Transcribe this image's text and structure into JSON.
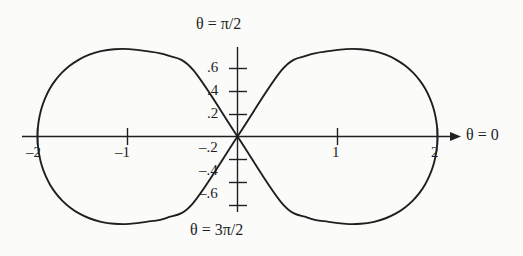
{
  "figure": {
    "problem_number": ".",
    "background_color": "#fbfbfa",
    "ink_color": "#1f1f1f"
  },
  "labels": {
    "theta_top": "θ = π/2",
    "theta_bottom": "θ = 3π/2",
    "theta_right": "θ = 0"
  },
  "axes": {
    "x_ticks": [
      {
        "value": -2,
        "label": "–2"
      },
      {
        "value": -1,
        "label": "–1"
      },
      {
        "value": 1,
        "label": "1"
      },
      {
        "value": 2,
        "label": "2"
      }
    ],
    "y_ticks": [
      {
        "value": 0.6,
        "label": ".6"
      },
      {
        "value": 0.4,
        "label": ".4"
      },
      {
        "value": 0.2,
        "label": ".2"
      },
      {
        "value": -0.2,
        "label": "–.2"
      },
      {
        "value": -0.4,
        "label": "–.4"
      },
      {
        "value": -0.6,
        "label": "–.6"
      }
    ]
  },
  "chart_data": {
    "type": "line",
    "title": "",
    "subtitle": "",
    "xlabel": "θ = 0",
    "ylabel": "θ = π/2",
    "curve_name": "lemniscate",
    "polar_equation": "r^2 = 4 cos(2θ)",
    "coordinate_system": "polar",
    "grid": false,
    "legend": false,
    "xlim": [
      -2.15,
      2.18
    ],
    "ylim": [
      -0.78,
      0.78
    ],
    "xticks": [
      -2,
      -1,
      1,
      2
    ],
    "yticks": [
      0.6,
      0.4,
      0.2,
      -0.2,
      -0.4,
      -0.6
    ],
    "axis_arrow": "right",
    "annotations": [
      {
        "text": "θ = π/2",
        "position": "top-of-y-axis"
      },
      {
        "text": "θ = 3π/2",
        "position": "bottom-of-y-axis"
      },
      {
        "text": "θ = 0",
        "position": "right-of-x-axis"
      }
    ],
    "series": [
      {
        "name": "r^2 = 4 cos(2θ)",
        "color": "#1f1f1f",
        "x": [
          2.0,
          1.995,
          1.98,
          1.956,
          1.921,
          1.876,
          1.82,
          1.753,
          1.675,
          1.585,
          1.482,
          1.366,
          1.234,
          1.084,
          0.911,
          0.707,
          0.448,
          0.0,
          -0.448,
          -0.707,
          -0.911,
          -1.084,
          -1.234,
          -1.366,
          -1.482,
          -1.585,
          -1.675,
          -1.753,
          -1.82,
          -1.876,
          -1.921,
          -1.956,
          -1.98,
          -1.995,
          -2.0,
          -1.995,
          -1.98,
          -1.956,
          -1.921,
          -1.876,
          -1.82,
          -1.753,
          -1.675,
          -1.585,
          -1.482,
          -1.366,
          -1.234,
          -1.084,
          -0.911,
          -0.707,
          -0.448,
          0.0,
          0.448,
          0.707,
          0.911,
          1.084,
          1.234,
          1.366,
          1.482,
          1.585,
          1.675,
          1.753,
          1.82,
          1.876,
          1.921,
          1.956,
          1.98,
          1.995,
          2.0
        ],
        "y": [
          0.0,
          0.087,
          0.173,
          0.257,
          0.339,
          0.417,
          0.49,
          0.557,
          0.617,
          0.669,
          0.711,
          0.742,
          0.759,
          0.76,
          0.742,
          0.707,
          0.583,
          0.0,
          -0.583,
          -0.707,
          -0.742,
          -0.76,
          -0.759,
          -0.742,
          -0.711,
          -0.669,
          -0.617,
          -0.557,
          -0.49,
          -0.417,
          -0.339,
          -0.257,
          -0.173,
          -0.087,
          0.0,
          0.087,
          0.173,
          0.257,
          0.339,
          0.417,
          0.49,
          0.557,
          0.617,
          0.669,
          0.711,
          0.742,
          0.759,
          0.76,
          0.742,
          0.707,
          0.583,
          0.0,
          -0.583,
          -0.707,
          -0.742,
          -0.76,
          -0.759,
          -0.742,
          -0.711,
          -0.669,
          -0.617,
          -0.557,
          -0.49,
          -0.417,
          -0.339,
          -0.257,
          -0.173,
          -0.087,
          0.0
        ],
        "max_r": 2,
        "max_y": 0.76,
        "min_y": -0.76,
        "x_intercepts": [
          -2,
          0,
          2
        ]
      }
    ]
  }
}
